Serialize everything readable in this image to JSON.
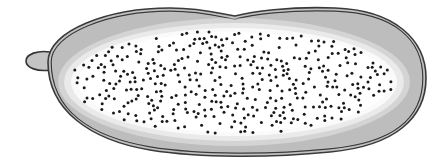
{
  "diagram": {
    "nuclei_count_approx": 400,
    "colors": {
      "outline": "#3a3a3a",
      "rim_shade": "#bdbdbd",
      "interior": "#ffffff",
      "nucleus": "#1a1a1a",
      "background": "#ffffff"
    },
    "parts": [
      "outer-membrane",
      "inner-membrane",
      "cortical-rim",
      "micropyle",
      "nuclei"
    ]
  }
}
